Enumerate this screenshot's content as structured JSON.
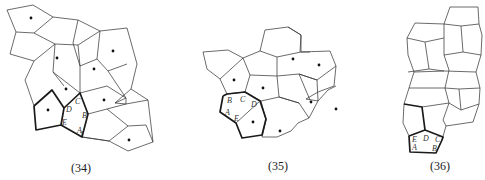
{
  "figures": [
    {
      "caption": "(34)",
      "vertex_labels": [
        "A",
        "B",
        "C",
        "D",
        "E"
      ],
      "dot_count": 8
    },
    {
      "caption": "(35)",
      "vertex_labels": [
        "A",
        "B",
        "C",
        "D",
        "E"
      ],
      "dot_count": 8
    },
    {
      "caption": "(36)",
      "vertex_labels": [
        "A",
        "B",
        "C",
        "D",
        "E"
      ],
      "dot_count": 0
    }
  ],
  "colors": {
    "line": "#3a3a3a",
    "bold_line": "#1a1a1a",
    "background": "#ffffff"
  }
}
